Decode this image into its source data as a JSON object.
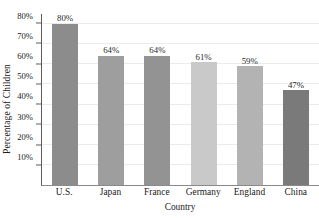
{
  "chart_data": {
    "type": "bar",
    "title": "",
    "xlabel": "Country",
    "ylabel": "Percentage of Children",
    "categories": [
      "U.S.",
      "Japan",
      "France",
      "Germany",
      "England",
      "China"
    ],
    "values": [
      80,
      64,
      64,
      61,
      59,
      47
    ],
    "value_labels": [
      "80%",
      "64%",
      "64%",
      "61%",
      "59%",
      "47%"
    ],
    "ylim": [
      0,
      85
    ],
    "ytick_values": [
      10,
      20,
      30,
      40,
      50,
      60,
      70,
      80
    ],
    "ytick_labels": [
      "10%",
      "20%",
      "30%",
      "40%",
      "50%",
      "60%",
      "70%",
      "80%"
    ],
    "grid": "horizontal",
    "legend": "none",
    "bar_colors": [
      "#8c8c8c",
      "#9e9e9e",
      "#939393",
      "#c9c9c9",
      "#b3b3b3",
      "#7a7a7a"
    ],
    "gridline_color": "#ebebeb",
    "axis_color": "#5c5c5c"
  }
}
